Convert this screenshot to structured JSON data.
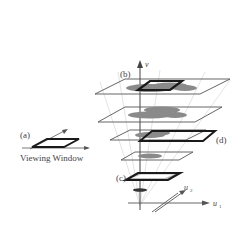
{
  "labels": {
    "a": "(a)",
    "b": "(b)",
    "c": "(c)",
    "d": "(d)",
    "viewing_window": "Viewing Window",
    "axis_v": "v",
    "axis_u1": "u",
    "axis_u1_sub": "1",
    "axis_u2": "u",
    "axis_u2_sub": "2"
  },
  "colors": {
    "line": "#555555",
    "thick": "#222222",
    "blob": "#8a8a8a",
    "blob_dark": "#6e6e6e",
    "cone": "#d8d8d8"
  }
}
